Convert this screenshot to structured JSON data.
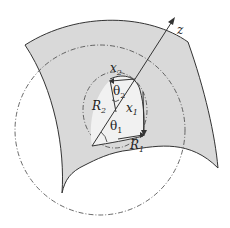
{
  "diagram": {
    "type": "geometry-figure",
    "colors": {
      "surface_fill": "#d9d9d9",
      "line": "#333333",
      "background": "#ffffff"
    },
    "labels": {
      "z_axis": "z",
      "x1": "x",
      "x1_sub": "1",
      "x2": "x",
      "x2_sub": "2",
      "R1": "R",
      "R1_sub": "1",
      "R2": "R",
      "R2_sub": "2",
      "theta1": "θ",
      "theta1_sub": "1",
      "theta2": "θ",
      "theta2_sub": "2"
    },
    "elements": [
      "shaded curved surface patch",
      "large dash-dot circle (radius R1 curvature)",
      "small dash-dot circle (radius R2 curvature)",
      "z-axis arrow normal to surface",
      "x1 and x2 tangent directions",
      "angles theta1 and theta2"
    ]
  }
}
